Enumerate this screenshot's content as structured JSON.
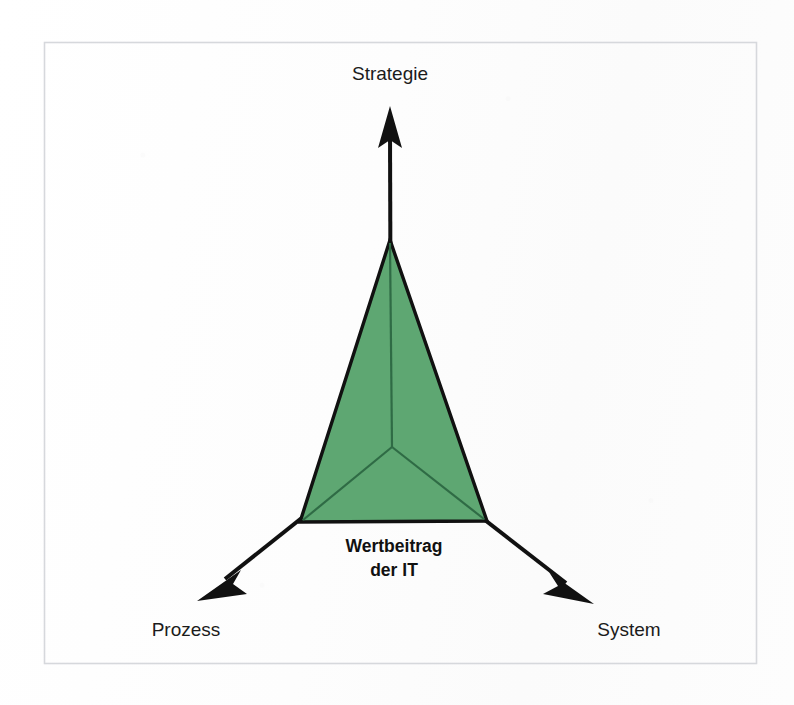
{
  "figure": {
    "title": "Wertbeitrag der IT",
    "background_color": "#fefefe",
    "frame": {
      "name": "figure-border",
      "color": "#d6d8dc",
      "x": 44,
      "y": 42,
      "width": 713,
      "height": 622
    },
    "axes": [
      {
        "id": "strategie",
        "label": "Strategie",
        "direction": "up",
        "origin": [
          391,
          447
        ],
        "tip": [
          390,
          106
        ],
        "label_position": [
          390,
          80
        ],
        "color": "#111111"
      },
      {
        "id": "prozess",
        "label": "Prozess",
        "direction": "down-left",
        "origin": [
          391,
          447
        ],
        "tip": [
          197,
          601
        ],
        "label_position": [
          186,
          636
        ],
        "color": "#111111"
      },
      {
        "id": "system",
        "label": "System",
        "direction": "down-right",
        "origin": [
          391,
          447
        ],
        "tip": [
          594,
          604
        ],
        "label_position": [
          629,
          636
        ],
        "color": "#111111"
      }
    ],
    "shape": {
      "name": "value-contribution-triangle",
      "type": "polygon",
      "fill_color": "#5ea772",
      "stroke_color": "#111111",
      "stroke_width": 3.2,
      "inner_line_color": "#2f6b45",
      "vertices": [
        [
          390,
          240
        ],
        [
          300,
          522
        ],
        [
          487,
          521
        ]
      ],
      "centroid": [
        392,
        447
      ]
    },
    "center_label": {
      "line1": "Wertbeitrag",
      "line2": "der IT",
      "position": [
        394,
        551
      ],
      "font_weight": "bold"
    }
  }
}
